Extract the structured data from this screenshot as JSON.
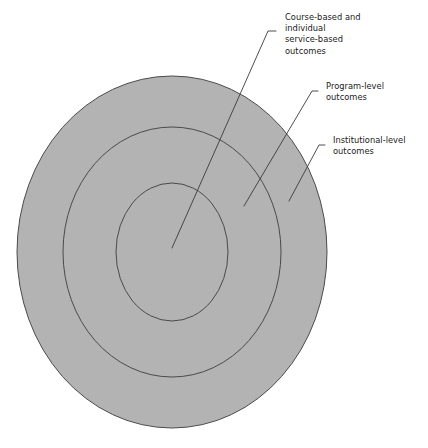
{
  "figure": {
    "type": "nested-concentric-ellipses",
    "background_color": "#ffffff",
    "fill_color": "#b3b3b3",
    "stroke_color": "#4a4a4a",
    "text_color": "#1a1a1a",
    "rings": [
      {
        "id": "outer",
        "name": "institutional-level-ring",
        "cx": 172,
        "cy": 252,
        "rx": 155,
        "ry": 176
      },
      {
        "id": "middle",
        "name": "program-level-ring",
        "cx": 172,
        "cy": 252,
        "rx": 109,
        "ry": 125
      },
      {
        "id": "inner",
        "name": "course-based-ring",
        "cx": 172,
        "cy": 252,
        "rx": 56,
        "ry": 69
      }
    ],
    "callouts": [
      {
        "id": "course",
        "name": "course-based-outcomes-callout",
        "lines": [
          "Course-based and",
          "individual",
          "service-based",
          "outcomes"
        ],
        "text_x": 263,
        "text_y": 20,
        "leader_path": "M 276 31 L 268 31 L 172 248",
        "target_ring": "inner"
      },
      {
        "id": "program",
        "name": "program-level-outcomes-callout",
        "lines": [
          "Program-level",
          "outcomes"
        ],
        "text_x": 320,
        "text_y": 86,
        "leader_path": "M 318 91 L 312 91 L 244 206",
        "target_ring": "middle"
      },
      {
        "id": "institutional",
        "name": "institutional-level-outcomes-callout",
        "lines": [
          "Institutional-level",
          "outcomes"
        ],
        "text_x": 327,
        "text_y": 140,
        "leader_path": "M 325 145 L 319 145 L 289 201",
        "target_ring": "outer"
      }
    ]
  }
}
